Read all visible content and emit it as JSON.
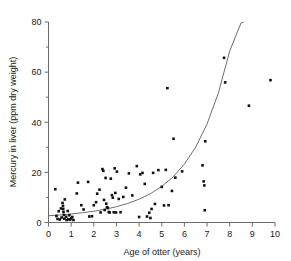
{
  "chart_data": {
    "type": "scatter",
    "title": "",
    "xlabel": "Age of otter (years)",
    "ylabel": "Mercury in liver (ppm dry weight)",
    "xlim": [
      0,
      10
    ],
    "ylim": [
      0,
      80
    ],
    "xticks": [
      0,
      1,
      2,
      3,
      4,
      5,
      6,
      7,
      8,
      9,
      10
    ],
    "xticklabels": [
      "0",
      "1",
      "2",
      "3",
      "4",
      "5",
      "6",
      "7",
      "8",
      "9",
      "10"
    ],
    "yticks": [
      0,
      20,
      40,
      60,
      80
    ],
    "yticklabels": [
      "0",
      "20",
      "40",
      "60",
      "80"
    ],
    "yminorticks": [
      10,
      30,
      50,
      70
    ],
    "grid": false,
    "legend": false,
    "marker": "square",
    "marker_color": "#111111",
    "curve_color": "#6e6e6e",
    "axis_color": "#6b6b6b",
    "points": [
      [
        0.3,
        13.3
      ],
      [
        0.35,
        2.6
      ],
      [
        0.4,
        1.4
      ],
      [
        0.45,
        4.5
      ],
      [
        0.5,
        1.2
      ],
      [
        0.55,
        5.6
      ],
      [
        0.58,
        2.0
      ],
      [
        0.62,
        7.8
      ],
      [
        0.64,
        6.6
      ],
      [
        0.65,
        5.4
      ],
      [
        0.66,
        4.2
      ],
      [
        0.68,
        3.0
      ],
      [
        0.7,
        1.5
      ],
      [
        0.72,
        9.2
      ],
      [
        0.78,
        2.3
      ],
      [
        0.8,
        1.0
      ],
      [
        0.85,
        4.6
      ],
      [
        0.88,
        1.3
      ],
      [
        0.92,
        2.9
      ],
      [
        0.95,
        1.1
      ],
      [
        1.0,
        1.6
      ],
      [
        1.05,
        2.2
      ],
      [
        1.1,
        1.0
      ],
      [
        1.25,
        11.6
      ],
      [
        1.3,
        15.9
      ],
      [
        1.45,
        6.9
      ],
      [
        1.55,
        5.2
      ],
      [
        1.75,
        16.2
      ],
      [
        1.8,
        2.4
      ],
      [
        1.92,
        2.5
      ],
      [
        2.0,
        6.9
      ],
      [
        2.1,
        8.1
      ],
      [
        2.15,
        11.5
      ],
      [
        2.25,
        13.1
      ],
      [
        2.3,
        4.0
      ],
      [
        2.38,
        21.3
      ],
      [
        2.42,
        20.6
      ],
      [
        2.45,
        9.0
      ],
      [
        2.48,
        5.0
      ],
      [
        2.52,
        17.8
      ],
      [
        2.55,
        7.5
      ],
      [
        2.58,
        6.1
      ],
      [
        2.62,
        5.8
      ],
      [
        2.66,
        4.2
      ],
      [
        2.7,
        4.0
      ],
      [
        2.75,
        17.5
      ],
      [
        2.8,
        10.9
      ],
      [
        2.84,
        9.9
      ],
      [
        2.88,
        4.1
      ],
      [
        2.92,
        21.6
      ],
      [
        2.95,
        11.8
      ],
      [
        2.98,
        4.0
      ],
      [
        3.02,
        20.3
      ],
      [
        3.1,
        9.4
      ],
      [
        3.18,
        4.1
      ],
      [
        3.3,
        10.2
      ],
      [
        3.42,
        13.9
      ],
      [
        3.55,
        19.6
      ],
      [
        3.7,
        10.8
      ],
      [
        3.9,
        22.5
      ],
      [
        4.0,
        2.2
      ],
      [
        4.05,
        19.2
      ],
      [
        4.15,
        19.8
      ],
      [
        4.25,
        15.4
      ],
      [
        4.35,
        2.4
      ],
      [
        4.45,
        3.9
      ],
      [
        4.5,
        1.8
      ],
      [
        4.55,
        5.4
      ],
      [
        4.62,
        19.8
      ],
      [
        4.7,
        7.4
      ],
      [
        4.85,
        20.9
      ],
      [
        5.0,
        14.2
      ],
      [
        5.1,
        6.8
      ],
      [
        5.18,
        21.0
      ],
      [
        5.25,
        53.6
      ],
      [
        5.3,
        6.9
      ],
      [
        5.45,
        12.6
      ],
      [
        5.52,
        33.4
      ],
      [
        5.6,
        17.9
      ],
      [
        5.9,
        20.4
      ],
      [
        6.8,
        22.8
      ],
      [
        6.85,
        16.4
      ],
      [
        6.88,
        14.8
      ],
      [
        6.9,
        4.9
      ],
      [
        6.92,
        32.4
      ],
      [
        7.75,
        65.7
      ],
      [
        7.8,
        55.9
      ],
      [
        8.85,
        46.6
      ],
      [
        9.8,
        56.8
      ]
    ],
    "fit_curve": {
      "label": "exponential fit",
      "x": [
        0.0,
        0.5,
        1.0,
        1.5,
        2.0,
        2.5,
        3.0,
        3.5,
        4.0,
        4.5,
        5.0,
        5.5,
        6.0,
        6.5,
        7.0,
        7.5,
        8.0,
        8.5,
        8.62
      ],
      "y": [
        2.7,
        3.0,
        3.4,
        3.9,
        4.5,
        5.3,
        6.3,
        7.6,
        9.3,
        11.5,
        14.4,
        18.2,
        23.3,
        30.1,
        39.3,
        51.7,
        68.4,
        79.6,
        80.0
      ]
    }
  }
}
